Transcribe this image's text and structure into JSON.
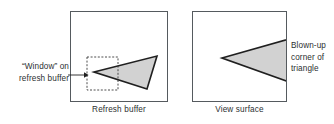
{
  "figure": {
    "width": 334,
    "height": 124,
    "background": "#ffffff"
  },
  "panels": [
    {
      "id": "refresh-buffer",
      "caption": "Refresh buffer",
      "x": 70,
      "y": 11,
      "width": 98,
      "height": 91
    },
    {
      "id": "view-surface",
      "caption": "View surface",
      "x": 192,
      "y": 11,
      "width": 95,
      "height": 91
    }
  ],
  "annotations": {
    "window_label_line1": "“Window” on",
    "window_label_line2": "refresh buffer",
    "blowup_label_line1": "Blown-up",
    "blowup_label_line2": "corner of",
    "blowup_label_line3": "triangle"
  },
  "shapes": {
    "triangle_small": {
      "points": "94,72 157,56 147,89",
      "fill": "#d2d2d2",
      "stroke": "#1f1f1f",
      "stroke_width": 1.6
    },
    "triangle_blownup": {
      "points": "222,58 300,36 300,86",
      "fill": "#d2d2d2",
      "stroke": "#1f1f1f",
      "stroke_width": 1.6
    },
    "window_box": {
      "x": 87,
      "y": 57,
      "width": 31,
      "height": 33,
      "stroke": "#3a3a3a",
      "dash": "2,1.6"
    },
    "pointer_arrow": {
      "x1": 68,
      "y1": 75,
      "x2": 86,
      "y2": 75,
      "stroke": "#1f1f1f"
    }
  },
  "colors": {
    "panel_border": "#555a5e",
    "shape_fill": "#d2d2d2",
    "shape_stroke": "#1f1f1f",
    "text": "#2c2f31"
  }
}
